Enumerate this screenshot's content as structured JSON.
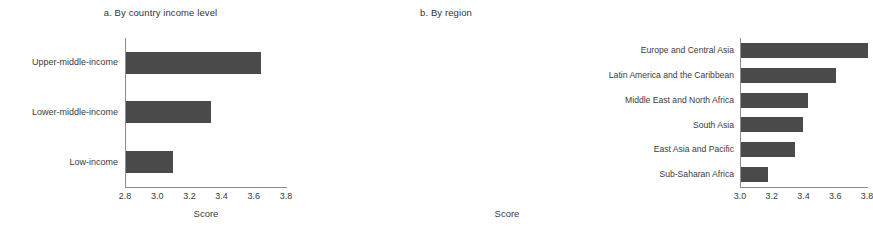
{
  "chart_data": [
    {
      "type": "bar",
      "orientation": "horizontal",
      "title": "a. By country income level",
      "categories": [
        "Upper-middle-income",
        "Lower-middle-income",
        "Low-income"
      ],
      "values": [
        3.64,
        3.33,
        3.09
      ],
      "xlabel": "Score",
      "ylabel": "",
      "xlim": [
        2.8,
        3.8
      ],
      "xticks": [
        "2.8",
        "3.0",
        "3.2",
        "3.4",
        "3.6",
        "3.8"
      ],
      "xtick_values": [
        2.8,
        3.0,
        3.2,
        3.4,
        3.6,
        3.8
      ],
      "grid": false,
      "legend": "none",
      "bar_color": "#4a4a4a",
      "axis_color": "#8d8d8d"
    },
    {
      "type": "bar",
      "orientation": "horizontal",
      "title": "b. By region",
      "categories": [
        "Europe and Central Asia",
        "Latin America and the Caribbean",
        "Middle East and North Africa",
        "South Asia",
        "East Asia and Pacific",
        "Sub-Saharan Africa"
      ],
      "values": [
        3.8,
        3.6,
        3.42,
        3.39,
        3.34,
        3.17
      ],
      "xlabel": "Score",
      "ylabel": "",
      "xlim": [
        3.0,
        3.8
      ],
      "xticks": [
        "3.0",
        "3.2",
        "3.4",
        "3.6",
        "3.8"
      ],
      "xtick_values": [
        3.0,
        3.2,
        3.4,
        3.6,
        3.8
      ],
      "grid": false,
      "legend": "none",
      "bar_color": "#4a4a4a",
      "axis_color": "#8d8d8d"
    }
  ]
}
